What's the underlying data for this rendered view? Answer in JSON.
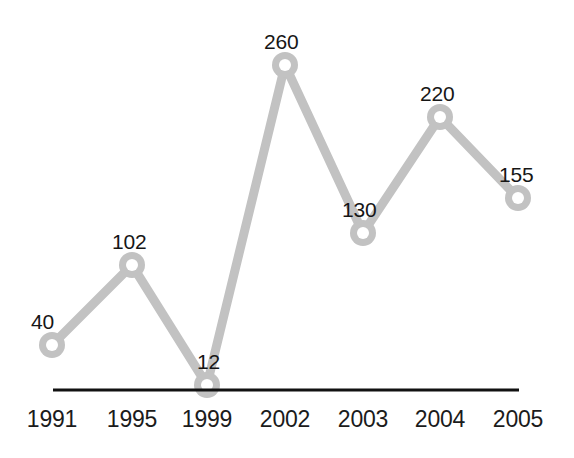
{
  "chart_data": {
    "type": "line",
    "title": "",
    "subtitle": "",
    "xlabel": "",
    "ylabel": "",
    "categories": [
      "1991",
      "1995",
      "1999",
      "2002",
      "2003",
      "2004",
      "2005"
    ],
    "values": [
      40,
      102,
      12,
      260,
      220,
      155,
      130
    ],
    "series": [
      {
        "name": "",
        "values": [
          40,
          102,
          12,
          260,
          130,
          220,
          155
        ]
      }
    ],
    "points": [
      {
        "category": "1991",
        "value": 40,
        "label": "40",
        "px": 52,
        "py": 345,
        "label_x": 31,
        "label_y": 311
      },
      {
        "category": "1995",
        "value": 102,
        "label": "102",
        "px": 132,
        "py": 265,
        "label_x": 112,
        "label_y": 231
      },
      {
        "category": "1999",
        "value": 12,
        "label": "12",
        "px": 207,
        "py": 385,
        "label_x": 197,
        "label_y": 351
      },
      {
        "category": "2002",
        "value": 260,
        "label": "260",
        "px": 285,
        "py": 65,
        "label_x": 264,
        "label_y": 31
      },
      {
        "category": "2003",
        "value": 130,
        "label": "130",
        "px": 363,
        "py": 233,
        "label_x": 342,
        "label_y": 199
      },
      {
        "category": "2004",
        "value": 220,
        "label": "220",
        "px": 440,
        "py": 117,
        "label_x": 420,
        "label_y": 83
      },
      {
        "category": "2005",
        "value": 155,
        "label": "155",
        "px": 518,
        "py": 198,
        "label_x": 499,
        "label_y": 164
      }
    ],
    "tick_labels": [
      {
        "text": "1991",
        "x": 52,
        "y": 408
      },
      {
        "text": "1995",
        "x": 132,
        "y": 408
      },
      {
        "text": "1999",
        "x": 207,
        "y": 408
      },
      {
        "text": "2002",
        "x": 285,
        "y": 408
      },
      {
        "text": "2003",
        "x": 363,
        "y": 408
      },
      {
        "text": "2004",
        "x": 440,
        "y": 408
      },
      {
        "text": "2005",
        "x": 518,
        "y": 408
      }
    ],
    "ylim": [
      0,
      280
    ],
    "grid": false,
    "legend": false,
    "legend_position": "none",
    "axis": {
      "x_start": 53,
      "x_end": 519,
      "y": 390
    },
    "colors": {
      "line": "#c2c2c2",
      "marker_ring": "#c2c2c2",
      "marker_fill": "#ffffff",
      "axis": "#111111",
      "value_label": "#161616",
      "tick_label": "#1b1b1b",
      "background": "#ffffff"
    },
    "style": {
      "line_width": 9,
      "marker_outer_radius": 13,
      "marker_inner_radius": 6
    }
  }
}
